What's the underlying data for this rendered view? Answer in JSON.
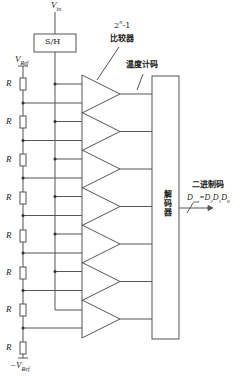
{
  "diagram": {
    "input_label": "V",
    "input_sub": "in",
    "sh_label": "S/H",
    "vref_top": "V",
    "vref_top_sub": "Ref",
    "vref_bottom": "−V",
    "vref_bottom_sub": "Ref",
    "resistor_label": "R",
    "resistor_count": 8,
    "comparator_count_label": "2",
    "comparator_count_sup": "N",
    "comparator_count_suffix": "-1",
    "comparator_label": "比较器",
    "thermometer_label": "温度计码",
    "decoder_label": "解码器",
    "binary_label": "二进制码",
    "output_label": "D",
    "output_sub": "out",
    "output_eq": "=D",
    "output_bits": [
      "2",
      "1",
      "0"
    ],
    "plus": "+",
    "minus": "−",
    "comparators": 7,
    "line_color": "#555555"
  }
}
